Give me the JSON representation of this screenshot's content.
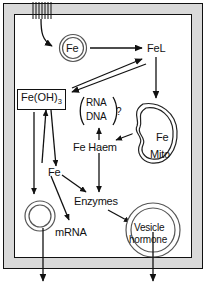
{
  "diagram": {
    "colors": {
      "ink": "#111111",
      "membrane": "#d9d9d9",
      "organelle_stroke": "#555555",
      "background": "#ffffff"
    },
    "membrane": {
      "channel_name": "membrane-channel-hatching",
      "channel_line_count": 7
    },
    "nodes": {
      "fe_receptor": {
        "label": "Fe",
        "shape": "double-circle"
      },
      "fel": {
        "label": "FeL",
        "shape": "text"
      },
      "fe_oh3": {
        "label": "Fe(OH)",
        "subscript": "3",
        "shape": "box"
      },
      "rna_dna": {
        "line1": "RNA",
        "line2": "DNA",
        "bracket": "parentheses",
        "query": "?"
      },
      "fe_haem": {
        "label": "Fe Haem",
        "shape": "text"
      },
      "mitochondrion": {
        "line1": "Fe",
        "line2": "Mito",
        "shape": "mitochondrion"
      },
      "fe_pool": {
        "label": "Fe",
        "shape": "text"
      },
      "enzymes": {
        "label": "Enzymes",
        "shape": "text"
      },
      "mrna": {
        "label": "mRNA",
        "shape": "text",
        "glyph": "double-ring"
      },
      "vesicle": {
        "line1": "Vesicle",
        "line2": "hormone",
        "shape": "double-circle"
      }
    },
    "edges": [
      {
        "name": "uptake-into-cell",
        "from": "membrane-channel",
        "to": "fe_receptor",
        "style": "curved-arrow"
      },
      {
        "name": "fe-to-fel",
        "from": "fe_receptor",
        "to": "fel",
        "style": "straight-arrow"
      },
      {
        "name": "fel-to-feoh3",
        "from": "fel",
        "to": "fe_oh3",
        "style": "diagonal-arrow"
      },
      {
        "name": "feoh3-to-fel",
        "from": "fe_oh3",
        "to": "fel",
        "style": "diagonal-arrow"
      },
      {
        "name": "fel-to-mitochondrion",
        "from": "fel",
        "to": "mitochondrion",
        "style": "straight-arrow"
      },
      {
        "name": "fe-pool-to-feoh3",
        "from": "fe_pool",
        "to": "fe_oh3",
        "style": "straight-arrow"
      },
      {
        "name": "feoh3-to-fe-pool",
        "from": "fe_oh3",
        "to": "fe_pool",
        "style": "straight-arrow"
      },
      {
        "name": "feoh3-to-mrna-ring",
        "from": "fe_oh3",
        "to": "mrna",
        "style": "straight-arrow"
      },
      {
        "name": "fe-pool-to-mrna",
        "from": "fe_pool",
        "to": "mrna",
        "style": "straight-arrow"
      },
      {
        "name": "fe-pool-to-enzymes",
        "from": "fe_pool",
        "to": "enzymes",
        "style": "straight-arrow"
      },
      {
        "name": "fe-haem-to-rna-dna",
        "from": "fe_haem",
        "to": "rna_dna",
        "style": "straight-arrow"
      },
      {
        "name": "fe-haem-to-enzymes",
        "from": "fe_haem",
        "to": "enzymes",
        "style": "straight-arrow"
      },
      {
        "name": "mitochondrion-to-fe-haem",
        "from": "mitochondrion",
        "to": "fe_haem",
        "style": "straight-arrow"
      },
      {
        "name": "enzymes-to-vesicle",
        "from": "enzymes",
        "to": "vesicle",
        "style": "straight-arrow"
      },
      {
        "name": "mrna-ring-export",
        "from": "mrna",
        "to": "extracellular",
        "style": "straight-arrow"
      },
      {
        "name": "vesicle-export",
        "from": "vesicle",
        "to": "extracellular",
        "style": "straight-arrow"
      }
    ]
  }
}
